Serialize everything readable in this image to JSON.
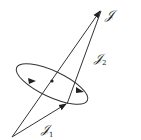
{
  "diagram": {
    "stroke_color": "#333333",
    "vectors": [
      {
        "name": "J",
        "label": "𝒥",
        "subscript": ""
      },
      {
        "name": "J1",
        "label": "𝒥",
        "subscript": "1"
      },
      {
        "name": "J2",
        "label": "𝒥",
        "subscript": "2"
      }
    ],
    "labels": {
      "total": "𝒥",
      "j1": "𝒥",
      "j1_sub": "1",
      "j2": "𝒥",
      "j2_sub": "2"
    }
  }
}
